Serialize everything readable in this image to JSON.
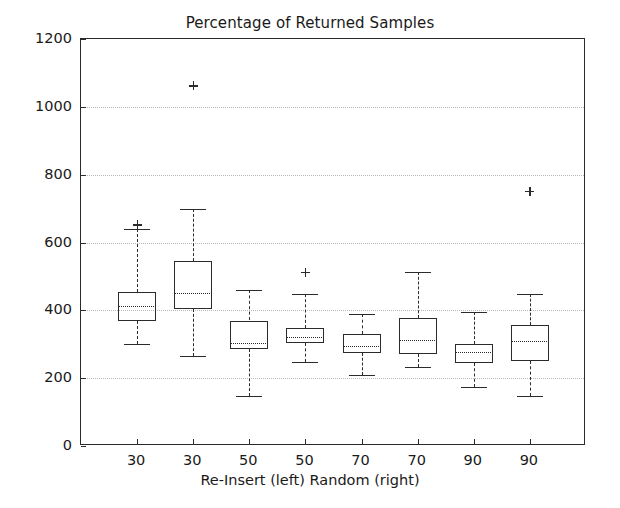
{
  "chart_data": {
    "type": "box",
    "title": "Percentage of Returned Samples",
    "xlabel": "Re-Insert (left)  Random (right)",
    "ylabel": "Time in seconds",
    "ylim": [
      0,
      1200
    ],
    "yticks": [
      0,
      200,
      400,
      600,
      800,
      1000,
      1200
    ],
    "ytick_labels": [
      "0",
      "200",
      "400",
      "600",
      "800",
      "1000",
      "1200"
    ],
    "grid": true,
    "grid_axis": "y",
    "legend": null,
    "categories": [
      "30",
      "30",
      "50",
      "50",
      "70",
      "70",
      "90",
      "90"
    ],
    "group_labels": [
      "Re-Insert",
      "Random",
      "Re-Insert",
      "Random",
      "Re-Insert",
      "Random",
      "Re-Insert",
      "Random"
    ],
    "boxes": [
      {
        "label": "30",
        "group": "Re-Insert",
        "whisker_low": 300,
        "q1": 370,
        "median": 412,
        "q3": 455,
        "whisker_high": 640,
        "fliers": [
          652
        ]
      },
      {
        "label": "30",
        "group": "Random",
        "whisker_low": 265,
        "q1": 405,
        "median": 450,
        "q3": 545,
        "whisker_high": 700,
        "fliers": [
          1062
        ]
      },
      {
        "label": "50",
        "group": "Re-Insert",
        "whisker_low": 148,
        "q1": 285,
        "median": 303,
        "q3": 370,
        "whisker_high": 460,
        "fliers": []
      },
      {
        "label": "50",
        "group": "Random",
        "whisker_low": 248,
        "q1": 305,
        "median": 322,
        "q3": 347,
        "whisker_high": 448,
        "fliers": [
          512
        ]
      },
      {
        "label": "70",
        "group": "Re-Insert",
        "whisker_low": 208,
        "q1": 275,
        "median": 295,
        "q3": 330,
        "whisker_high": 388,
        "fliers": []
      },
      {
        "label": "70",
        "group": "Random",
        "whisker_low": 232,
        "q1": 272,
        "median": 312,
        "q3": 378,
        "whisker_high": 512,
        "fliers": []
      },
      {
        "label": "90",
        "group": "Re-Insert",
        "whisker_low": 175,
        "q1": 245,
        "median": 278,
        "q3": 300,
        "whisker_high": 395,
        "fliers": []
      },
      {
        "label": "90",
        "group": "Random",
        "whisker_low": 148,
        "q1": 250,
        "median": 310,
        "q3": 357,
        "whisker_high": 447,
        "fliers": [
          750
        ]
      }
    ],
    "colors": {
      "box_edge": "#2b2b2b",
      "median": "#2b2b2b",
      "whisker": "#2b2b2b",
      "grid": "#b8b8b8",
      "axis": "#2b2b2b",
      "text": "#1a1a1a",
      "background": "#ffffff"
    }
  }
}
